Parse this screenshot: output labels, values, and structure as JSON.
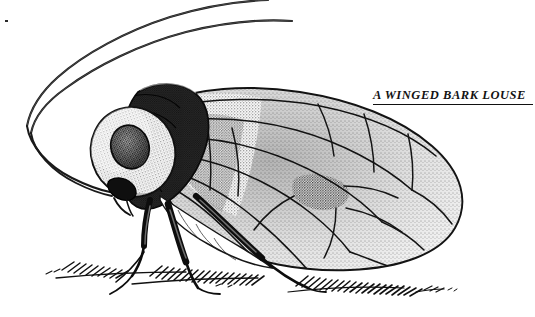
{
  "image": {
    "kind": "scientific-illustration",
    "technique": "pen-and-ink stipple engraving",
    "background_color": "#ffffff",
    "ink_color": "#111111",
    "width": 535,
    "height": 317
  },
  "caption": {
    "text": "A WINGED BARK LOUSE",
    "style": "bold italic small-caps serif, underlined",
    "color": "#121212",
    "underline_color": "#111111",
    "position": "top-right"
  },
  "subject": {
    "common_name": "winged bark louse",
    "order": "Psocoptera",
    "orientation": "left-facing lateral profile",
    "parts": [
      {
        "name": "antenna-upper",
        "description": "long filamentous antenna arcing up and right, exits top edge"
      },
      {
        "name": "antenna-lower",
        "description": "second long filamentous antenna arcing up and right, parallel to the first"
      },
      {
        "name": "head",
        "description": "bulbous head with large stippled compound eye"
      },
      {
        "name": "compound-eye",
        "description": "large oval dark stippled eye on side of head"
      },
      {
        "name": "mouthparts",
        "description": "short downward-pointing clypeus and labrum below the eye"
      },
      {
        "name": "thorax",
        "description": "dark humped thorax with heavy stipple shading"
      },
      {
        "name": "forewing",
        "description": "large held-roofwise forewing occupying right two thirds, stippled membrane with branched venation and polygonal cells"
      },
      {
        "name": "pterostigma",
        "description": "elongate dark cell along the leading edge of the forewing"
      },
      {
        "name": "abdomen",
        "description": "pale abdomen partly hidden beneath the wing"
      },
      {
        "name": "foreleg",
        "description": "front leg reaching down-left to the substrate"
      },
      {
        "name": "midleg",
        "description": "middle leg planted on the substrate"
      },
      {
        "name": "hindleg",
        "description": "long hind leg angled back to the right onto the substrate"
      }
    ]
  },
  "ground": {
    "name": "substrate",
    "description": "bark surface suggested by dense short hatch strokes along the lower edge",
    "span_x": [
      55,
      455
    ],
    "baseline_y": 280
  }
}
